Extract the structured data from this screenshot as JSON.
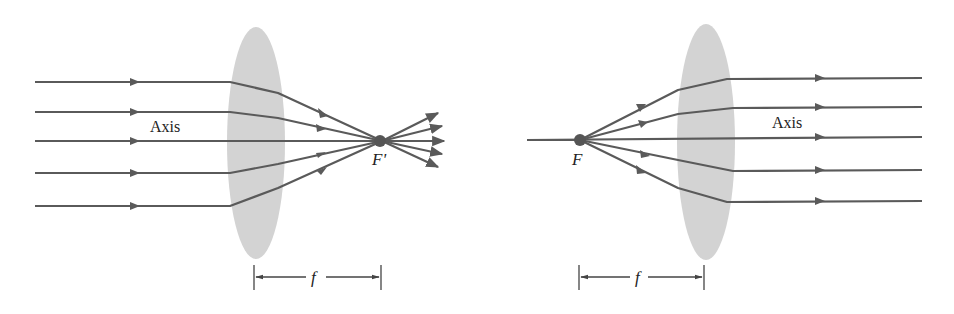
{
  "diagram": {
    "type": "converging-lens-ray-diagram",
    "colors": {
      "ray": "#5a5a5a",
      "lens": "#d3d3d3",
      "text": "#222222",
      "background": "#ffffff"
    },
    "left_panel": {
      "description": "Parallel rays converge through lens to focal point F'",
      "axis_label": "Axis",
      "focal_point_label": "F'",
      "focal_length_label": "f",
      "ray_count": 5
    },
    "right_panel": {
      "description": "Rays from focal point F emerge parallel after lens",
      "axis_label": "Axis",
      "focal_point_label": "F",
      "focal_length_label": "f",
      "ray_count": 5
    }
  }
}
